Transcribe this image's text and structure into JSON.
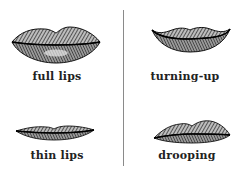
{
  "figure": {
    "divider": true,
    "panels": [
      {
        "id": "full",
        "label": "full lips",
        "shape": "full-lips-icon"
      },
      {
        "id": "turning-up",
        "label": "turning-up",
        "shape": "upturned-lips-icon"
      },
      {
        "id": "thin",
        "label": "thin lips",
        "shape": "thin-lips-icon"
      },
      {
        "id": "drooping",
        "label": "drooping",
        "shape": "drooping-lips-icon"
      }
    ]
  },
  "colors": {
    "ink": "#1a1a1a",
    "divider": "#8a8a8a",
    "background": "#ffffff"
  }
}
